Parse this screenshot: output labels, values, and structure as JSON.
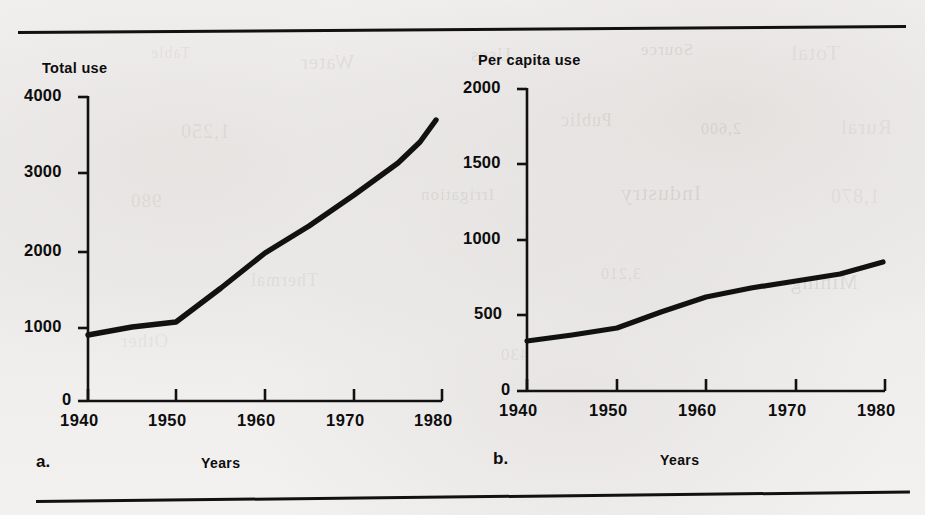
{
  "figure": {
    "background_color": "#f2f0ef",
    "ink_color": "#111111",
    "top_rule": "horizontal-rule",
    "bottom_rule": "horizontal-rule",
    "ghost_bleed_through": [
      "Table",
      "Water",
      "Uses",
      "Source",
      "Total",
      "1,250",
      "Public",
      "2,600",
      "Rural",
      "980",
      "Irrigation",
      "Industry",
      "1,870",
      "Thermal",
      "3,210",
      "Mining",
      "Other",
      "430"
    ]
  },
  "chart_data": [
    {
      "type": "line",
      "panel": "a.",
      "title": "Total use",
      "xlabel": "Years",
      "ylabel": "Total use",
      "xticks": [
        1940,
        1950,
        1960,
        1970,
        1980
      ],
      "xtick_labels": [
        "1940",
        "1950",
        "1960",
        "1970",
        "1980"
      ],
      "yticks": [
        0,
        1000,
        2000,
        3000,
        4000
      ],
      "ytick_labels": [
        "0",
        "1000",
        "2000",
        "3000",
        "4000"
      ],
      "xlim": [
        1940,
        1980
      ],
      "ylim": [
        0,
        4000
      ],
      "grid": false,
      "legend": null,
      "x": [
        1940,
        1945,
        1950,
        1955,
        1960,
        1965,
        1970,
        1975,
        1978.5
      ],
      "values": [
        870,
        1000,
        1120,
        1560,
        1975,
        2330,
        2700,
        3100,
        3680
      ]
    },
    {
      "type": "line",
      "panel": "b.",
      "title": "Per capita use",
      "xlabel": "Years",
      "ylabel": "Per capita use",
      "xticks": [
        1940,
        1950,
        1960,
        1970,
        1980
      ],
      "xtick_labels": [
        "1940",
        "1950",
        "1960",
        "1970",
        "1980"
      ],
      "yticks": [
        0,
        500,
        1000,
        1500,
        2000
      ],
      "ytick_labels": [
        "0",
        "500",
        "1000",
        "1500",
        "2000"
      ],
      "xlim": [
        1940,
        1980
      ],
      "ylim": [
        0,
        2000
      ],
      "grid": false,
      "legend": null,
      "x": [
        1940,
        1945,
        1950,
        1955,
        1960,
        1965,
        1970,
        1975,
        1979.5
      ],
      "values": [
        330,
        375,
        420,
        520,
        625,
        680,
        730,
        775,
        860
      ]
    }
  ],
  "panel_a": {
    "axis_title": "Total use",
    "panel_letter": "a.",
    "x_caption": "Years",
    "ytick_labels": [
      "4000",
      "3000",
      "2000",
      "1000",
      "0"
    ],
    "xtick_labels": [
      "1940",
      "1950",
      "1960",
      "1970",
      "1980"
    ]
  },
  "panel_b": {
    "axis_title": "Per capita use",
    "panel_letter": "b.",
    "x_caption": "Years",
    "ytick_labels": [
      "2000",
      "1500",
      "1000",
      "500",
      "0"
    ],
    "xtick_labels": [
      "1940",
      "1950",
      "1960",
      "1970",
      "1980"
    ]
  }
}
